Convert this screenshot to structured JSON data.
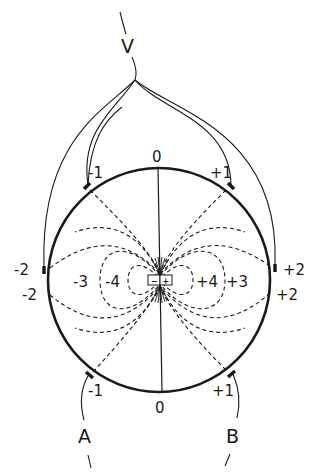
{
  "figure": {
    "terminals": {
      "voltage": "V",
      "current_a": "A",
      "current_b": "B"
    },
    "electrode_labels": {
      "top_zero": "0",
      "bottom_zero": "0",
      "top_left": "-1",
      "top_right": "+1",
      "bottom_left": "-1",
      "bottom_right": "+1",
      "left_upper": "-2",
      "left_lower": "-2",
      "right_upper": "+2",
      "right_lower": "+2"
    },
    "isopotential_labels": {
      "left_outer": "-3",
      "left_inner": "-4",
      "right_inner": "+4",
      "right_outer": "+3"
    },
    "dipole": {
      "negative": "−",
      "positive": "+"
    },
    "colors": {
      "ink": "#1a1a1a",
      "background": "#ffffff"
    }
  }
}
